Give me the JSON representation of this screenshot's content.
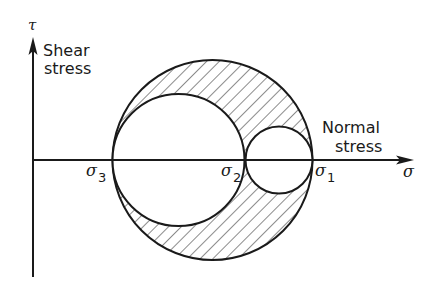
{
  "diagram": {
    "type": "mohr-circle-3d",
    "axes": {
      "y_symbol": "τ",
      "y_label_line1": "Shear",
      "y_label_line2": "stress",
      "x_symbol": "σ",
      "x_label_line1": "Normal",
      "x_label_line2": "stress"
    },
    "principal_stresses": [
      {
        "symbol": "σ",
        "subscript": "3"
      },
      {
        "symbol": "σ",
        "subscript": "2"
      },
      {
        "symbol": "σ",
        "subscript": "1"
      }
    ],
    "circles": [
      {
        "name": "outer",
        "between": "σ3-σ1"
      },
      {
        "name": "medium",
        "between": "σ3-σ2"
      },
      {
        "name": "small",
        "between": "σ2-σ1"
      }
    ],
    "hatched_region": "area inside outer circle outside the two inner circles",
    "colors": {
      "ink": "#1a1a1a",
      "background": "#ffffff"
    }
  }
}
